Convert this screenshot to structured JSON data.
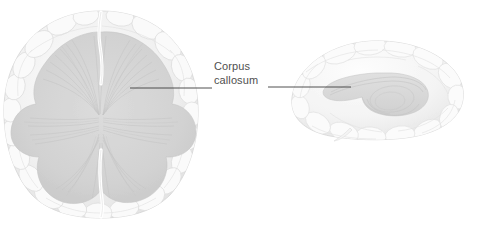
{
  "figure": {
    "type": "anatomical-illustration",
    "background_color": "#ffffff",
    "width": 486,
    "height": 229
  },
  "annotations": {
    "corpus_callosum": {
      "line1": "Corpus",
      "line2": "callosum",
      "text_color": "#4f4f4f",
      "leader_color": "#3c3c3c"
    }
  },
  "views": {
    "axial": {
      "name": "axial-brain-view",
      "description": "Axial (superior) dissection showing corpus callosum radiations",
      "cortex_color": "#f2f2f2",
      "fiber_color": "#d6d6d6",
      "outline_color": "#cfcfcf"
    },
    "sagittal": {
      "name": "sagittal-brain-view",
      "description": "Medial sagittal view showing corpus callosum arc",
      "cortex_color": "#f4f4f4",
      "fiber_color": "#dcdcdc",
      "outline_color": "#d2d2d2"
    }
  },
  "leaders": {
    "left": {
      "x1": 130,
      "y1": 88,
      "x2": 212,
      "y2": 88
    },
    "right": {
      "x1": 268,
      "y1": 87,
      "x2": 351,
      "y2": 87
    }
  }
}
